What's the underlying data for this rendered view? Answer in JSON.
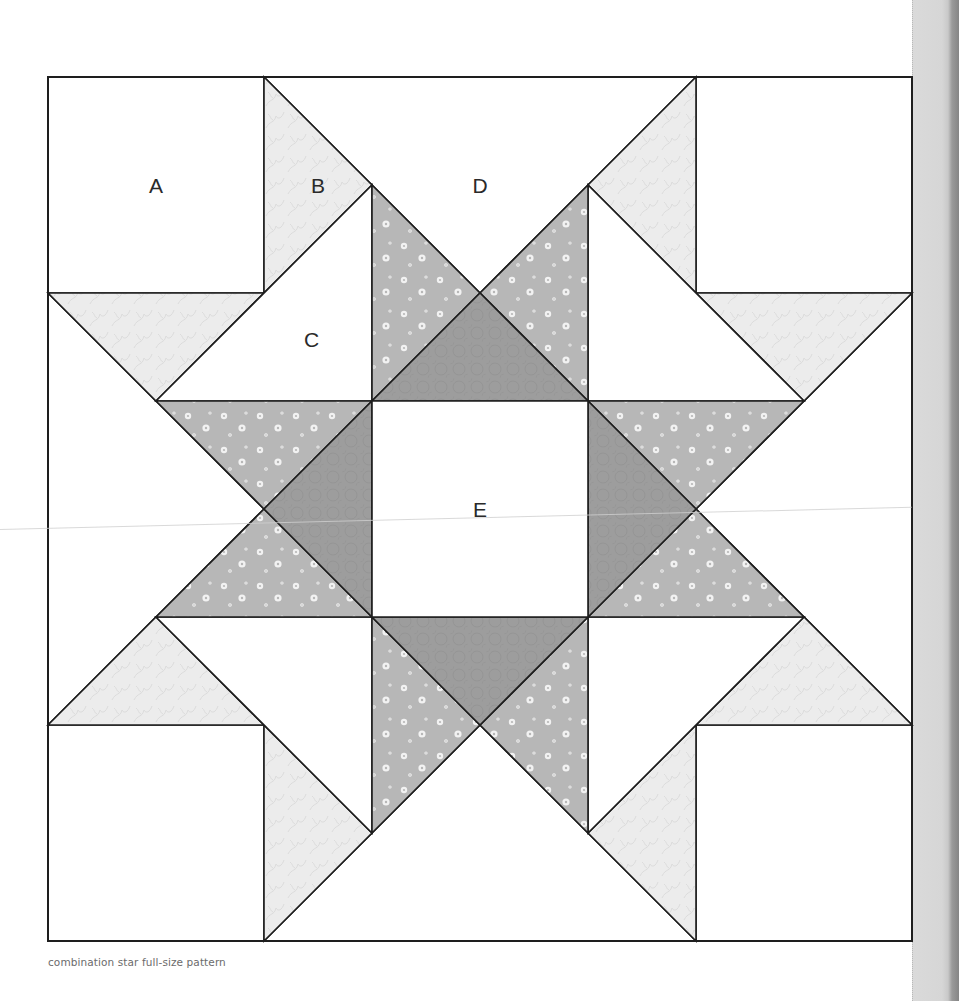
{
  "block": {
    "origin_px": [
      48,
      77
    ],
    "size_px": 864,
    "grid_units": 8,
    "title": "combination star full-size pattern"
  },
  "fabrics": {
    "background": {
      "name": "white",
      "color": "#ffffff"
    },
    "light": {
      "name": "light vine print",
      "color": "#ececec",
      "pattern": "#dcdcdc"
    },
    "medium": {
      "name": "medium floral print",
      "color": "#b7b7b7",
      "pattern": "#f2f2f2"
    },
    "dark": {
      "name": "dark circle print",
      "color": "#9d9d9d",
      "pattern": "#8f8f8f"
    }
  },
  "line_color": "#1e1e1e",
  "pieces": [
    {
      "id": "A-top-left",
      "label": "A",
      "fabric": "background",
      "points": [
        [
          0,
          0
        ],
        [
          2,
          0
        ],
        [
          2,
          2
        ],
        [
          0,
          2
        ]
      ]
    },
    {
      "id": "A-top-right",
      "label": "",
      "fabric": "background",
      "points": [
        [
          6,
          0
        ],
        [
          8,
          0
        ],
        [
          8,
          2
        ],
        [
          6,
          2
        ]
      ]
    },
    {
      "id": "A-bottom-left",
      "label": "",
      "fabric": "background",
      "points": [
        [
          0,
          6
        ],
        [
          2,
          6
        ],
        [
          2,
          8
        ],
        [
          0,
          8
        ]
      ]
    },
    {
      "id": "A-bottom-right",
      "label": "",
      "fabric": "background",
      "points": [
        [
          6,
          6
        ],
        [
          8,
          6
        ],
        [
          8,
          8
        ],
        [
          6,
          8
        ]
      ]
    },
    {
      "id": "D-top",
      "label": "D",
      "fabric": "background",
      "points": [
        [
          2,
          0
        ],
        [
          6,
          0
        ],
        [
          4,
          2
        ]
      ]
    },
    {
      "id": "D-bottom",
      "label": "",
      "fabric": "background",
      "points": [
        [
          2,
          8
        ],
        [
          6,
          8
        ],
        [
          4,
          6
        ]
      ]
    },
    {
      "id": "D-left",
      "label": "",
      "fabric": "background",
      "points": [
        [
          0,
          2
        ],
        [
          0,
          6
        ],
        [
          2,
          4
        ]
      ]
    },
    {
      "id": "D-right",
      "label": "",
      "fabric": "background",
      "points": [
        [
          8,
          2
        ],
        [
          8,
          6
        ],
        [
          6,
          4
        ]
      ]
    },
    {
      "id": "B-top-left",
      "label": "B",
      "fabric": "light",
      "points": [
        [
          2,
          0
        ],
        [
          3,
          1
        ],
        [
          2,
          2
        ]
      ]
    },
    {
      "id": "B-left-top",
      "label": "",
      "fabric": "light",
      "points": [
        [
          0,
          2
        ],
        [
          2,
          2
        ],
        [
          1,
          3
        ]
      ]
    },
    {
      "id": "B-top-right",
      "label": "",
      "fabric": "light",
      "points": [
        [
          6,
          0
        ],
        [
          5,
          1
        ],
        [
          6,
          2
        ]
      ]
    },
    {
      "id": "B-right-top",
      "label": "",
      "fabric": "light",
      "points": [
        [
          8,
          2
        ],
        [
          6,
          2
        ],
        [
          7,
          3
        ]
      ]
    },
    {
      "id": "B-bottom-left",
      "label": "",
      "fabric": "light",
      "points": [
        [
          2,
          8
        ],
        [
          3,
          7
        ],
        [
          2,
          6
        ]
      ]
    },
    {
      "id": "B-left-bottom",
      "label": "",
      "fabric": "light",
      "points": [
        [
          0,
          6
        ],
        [
          2,
          6
        ],
        [
          1,
          5
        ]
      ]
    },
    {
      "id": "B-bottom-right",
      "label": "",
      "fabric": "light",
      "points": [
        [
          6,
          8
        ],
        [
          5,
          7
        ],
        [
          6,
          6
        ]
      ]
    },
    {
      "id": "B-right-bottom",
      "label": "",
      "fabric": "light",
      "points": [
        [
          8,
          6
        ],
        [
          6,
          6
        ],
        [
          7,
          5
        ]
      ]
    },
    {
      "id": "C-top-left",
      "label": "C",
      "fabric": "background",
      "points": [
        [
          1,
          3
        ],
        [
          3,
          1
        ],
        [
          3,
          3
        ]
      ]
    },
    {
      "id": "C-top-right",
      "label": "",
      "fabric": "background",
      "points": [
        [
          7,
          3
        ],
        [
          5,
          1
        ],
        [
          5,
          3
        ]
      ]
    },
    {
      "id": "C-bottom-left",
      "label": "",
      "fabric": "background",
      "points": [
        [
          1,
          5
        ],
        [
          3,
          7
        ],
        [
          3,
          5
        ]
      ]
    },
    {
      "id": "C-bottom-right",
      "label": "",
      "fabric": "background",
      "points": [
        [
          7,
          5
        ],
        [
          5,
          7
        ],
        [
          5,
          5
        ]
      ]
    },
    {
      "id": "M-top-a",
      "label": "",
      "fabric": "medium",
      "points": [
        [
          3,
          1
        ],
        [
          4,
          2
        ],
        [
          3,
          3
        ]
      ]
    },
    {
      "id": "M-top-b",
      "label": "",
      "fabric": "medium",
      "points": [
        [
          5,
          1
        ],
        [
          4,
          2
        ],
        [
          5,
          3
        ]
      ]
    },
    {
      "id": "M-left-a",
      "label": "",
      "fabric": "medium",
      "points": [
        [
          1,
          3
        ],
        [
          2,
          4
        ],
        [
          3,
          3
        ]
      ]
    },
    {
      "id": "M-left-b",
      "label": "",
      "fabric": "medium",
      "points": [
        [
          1,
          5
        ],
        [
          2,
          4
        ],
        [
          3,
          5
        ]
      ]
    },
    {
      "id": "M-right-a",
      "label": "",
      "fabric": "medium",
      "points": [
        [
          7,
          3
        ],
        [
          6,
          4
        ],
        [
          5,
          3
        ]
      ]
    },
    {
      "id": "M-right-b",
      "label": "",
      "fabric": "medium",
      "points": [
        [
          7,
          5
        ],
        [
          6,
          4
        ],
        [
          5,
          5
        ]
      ]
    },
    {
      "id": "M-bottom-a",
      "label": "",
      "fabric": "medium",
      "points": [
        [
          3,
          7
        ],
        [
          4,
          6
        ],
        [
          3,
          5
        ]
      ]
    },
    {
      "id": "M-bottom-b",
      "label": "",
      "fabric": "medium",
      "points": [
        [
          5,
          7
        ],
        [
          4,
          6
        ],
        [
          5,
          5
        ]
      ]
    },
    {
      "id": "K-top",
      "label": "",
      "fabric": "dark",
      "points": [
        [
          3,
          3
        ],
        [
          5,
          3
        ],
        [
          4,
          2
        ]
      ]
    },
    {
      "id": "K-bottom",
      "label": "",
      "fabric": "dark",
      "points": [
        [
          3,
          5
        ],
        [
          5,
          5
        ],
        [
          4,
          6
        ]
      ]
    },
    {
      "id": "K-left",
      "label": "",
      "fabric": "dark",
      "points": [
        [
          3,
          3
        ],
        [
          3,
          5
        ],
        [
          2,
          4
        ]
      ]
    },
    {
      "id": "K-right",
      "label": "",
      "fabric": "dark",
      "points": [
        [
          5,
          3
        ],
        [
          5,
          5
        ],
        [
          6,
          4
        ]
      ]
    },
    {
      "id": "E-center",
      "label": "E",
      "fabric": "background",
      "points": [
        [
          3,
          3
        ],
        [
          5,
          3
        ],
        [
          5,
          5
        ],
        [
          3,
          5
        ]
      ]
    }
  ],
  "labels": [
    {
      "text": "A",
      "x": 1.0,
      "y": 1.0
    },
    {
      "text": "B",
      "x": 2.5,
      "y": 1.0
    },
    {
      "text": "D",
      "x": 4.0,
      "y": 1.0
    },
    {
      "text": "C",
      "x": 2.44,
      "y": 2.43
    },
    {
      "text": "E",
      "x": 4.0,
      "y": 4.0
    }
  ],
  "caption": "combination star full-size pattern"
}
